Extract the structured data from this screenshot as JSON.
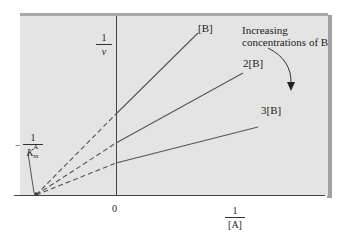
{
  "diagram": {
    "type": "lineweaver-burk-plot",
    "colors": {
      "panel_bg": "#e4e4e4",
      "panel_top_border": "#a9a9a9",
      "panel_shadow": "#a0a0a0",
      "line": "#555555",
      "axis": "#444444",
      "text": "#222222"
    },
    "y_axis_label": {
      "numerator": "1",
      "denominator": "v"
    },
    "x_axis_label": {
      "numerator": "1",
      "denominator": "[A]"
    },
    "origin_label": "0",
    "intercept_label": {
      "sign": "−",
      "numerator": "1",
      "denominator": "K",
      "sup": "A",
      "sub": "m"
    },
    "lines": [
      {
        "label": "[B]"
      },
      {
        "label": "2[B]"
      },
      {
        "label": "3[B]"
      }
    ],
    "annotation": {
      "line1": "Increasing",
      "line2": "concentrations of B"
    }
  }
}
